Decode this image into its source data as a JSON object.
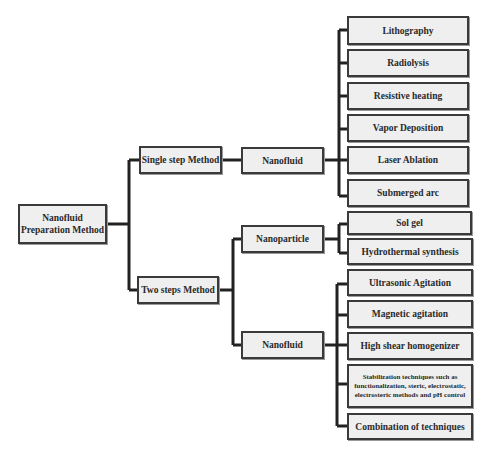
{
  "diagram": {
    "root": {
      "label": "Nanofluid Preparation Method"
    },
    "methods": {
      "single_step": {
        "label": "Single step Method",
        "child": {
          "label": "Nanofluid",
          "techniques": [
            "Lithography",
            "Radiolysis",
            "Resistive heating",
            "Vapor Deposition",
            "Laser Ablation",
            "Submerged arc"
          ]
        }
      },
      "two_steps": {
        "label": "Two steps Method",
        "nanoparticle": {
          "label": "Nanoparticle",
          "techniques": [
            "Sol gel",
            "Hydrothermal synthesis"
          ]
        },
        "nanofluid": {
          "label": "Nanofluid",
          "techniques": [
            "Ultrasonic Agitation",
            "Magnetic agitation",
            "High shear homogenizer",
            "Stabilization techniques such as functionalization, steric, electrostatic, electrosteric methods and pH control",
            "Combination of techniques"
          ]
        }
      }
    },
    "colors": {
      "box_fill": "#efefef",
      "box_border": "#3a3a3a",
      "connector": "#222222"
    }
  }
}
